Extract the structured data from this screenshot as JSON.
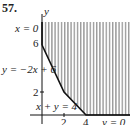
{
  "problem_number": "57.",
  "axes": {
    "x_label": "x",
    "y_label": "y"
  },
  "labels": {
    "x_eq_0": "x = 0",
    "y_tick_6": "6",
    "line1": "y = −2x + 6",
    "y_tick_2": "2",
    "line2": "x + y = 4",
    "x_tick_2": "2",
    "x_tick_4": "4",
    "y_eq_0": "y = 0"
  },
  "region": {
    "shading": "vertical hatching",
    "vertices": [
      [
        0,
        6
      ],
      [
        2,
        2
      ],
      [
        4,
        0
      ]
    ],
    "unbounded": true
  },
  "colors": {
    "hatch": "#9a9a9a",
    "boundary": "#111111"
  }
}
